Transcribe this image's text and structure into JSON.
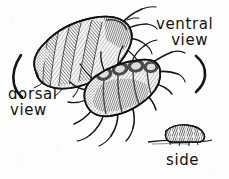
{
  "figure": {
    "background_color": "#fdfdfd",
    "ink_color": "#161616",
    "labels": {
      "dorsal_line1": "dorsal",
      "dorsal_line2": "view",
      "ventral_line1": "ventral",
      "ventral_line2": "view",
      "side": "side"
    },
    "specimens": [
      {
        "name": "dorsal-specimen",
        "view": "dorsal",
        "description": "Segmented louse body seen from above, tilted diagonally toward upper right, with legs and antennae projecting to the right"
      },
      {
        "name": "ventral-specimen",
        "view": "ventral",
        "description": "Louse seen from below with many legs radiating outward and downward"
      },
      {
        "name": "side-specimen",
        "view": "side",
        "description": "Small dark hump-shaped silhouette of the louse in profile resting on a ground line"
      }
    ],
    "brackets": [
      {
        "name": "left-bracket",
        "shape": "("
      },
      {
        "name": "right-bracket",
        "shape": ")"
      }
    ]
  }
}
